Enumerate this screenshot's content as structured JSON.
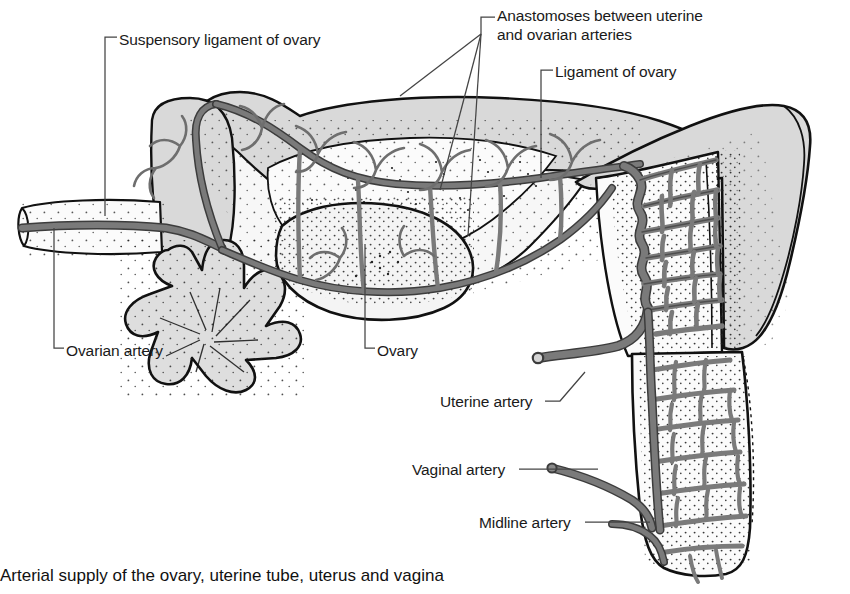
{
  "figure": {
    "caption": "Arterial supply of the ovary, uterine tube, uterus and vagina",
    "width": 850,
    "height": 594
  },
  "colors": {
    "background": "#ffffff",
    "outline": "#000000",
    "artery": "#7a7a7a",
    "artery_outline": "#3c3c3c",
    "tissue_light": "#f7f7f7",
    "tissue_shade": "#d9d9d9",
    "tissue_mid": "#e3e3e3",
    "leader_line": "#444444",
    "text": "#1a1a1a",
    "stipple": "#222222"
  },
  "labels": [
    {
      "id": "suspensory-ligament-of-ovary",
      "text": "Suspensory ligament of ovary",
      "x": 119,
      "y": 30,
      "leader": "bracket-left-down"
    },
    {
      "id": "anastomoses",
      "line1": "Anastomoses between uterine",
      "line2": "and ovarian arteries",
      "text": "Anastomoses between uterine and ovarian arteries",
      "x": 497,
      "y": 8,
      "leader": "fan-down-left"
    },
    {
      "id": "ligament-of-ovary",
      "text": "Ligament of ovary",
      "x": 555,
      "y": 62,
      "leader": "bracket-left-down"
    },
    {
      "id": "ovarian-artery",
      "text": "Ovarian artery",
      "x": 66,
      "y": 341,
      "leader": "bracket-left-up"
    },
    {
      "id": "ovary",
      "text": "Ovary",
      "x": 377,
      "y": 341,
      "leader": "bracket-left-up"
    },
    {
      "id": "uterine-artery",
      "text": "Uterine artery",
      "x": 440,
      "y": 394,
      "leader": "line-right-up"
    },
    {
      "id": "vaginal-artery",
      "text": "Vaginal artery",
      "x": 412,
      "y": 462,
      "leader": "line-right"
    },
    {
      "id": "midline-artery",
      "text": "Midline artery",
      "x": 479,
      "y": 515,
      "leader": "line-right"
    }
  ],
  "structures": [
    {
      "id": "uterine-tube",
      "name": "Uterine tube (broad ligament superior border)"
    },
    {
      "id": "mesosalpinx",
      "name": "Mesosalpinx"
    },
    {
      "id": "broad-ligament",
      "name": "Broad ligament"
    },
    {
      "id": "ovary-body",
      "name": "Ovary"
    },
    {
      "id": "fimbriae",
      "name": "Fimbriae of uterine tube"
    },
    {
      "id": "uterus-body",
      "name": "Body of uterus"
    },
    {
      "id": "uterus-fundus",
      "name": "Fundus of uterus"
    },
    {
      "id": "cervix",
      "name": "Cervix"
    },
    {
      "id": "vagina",
      "name": "Vagina"
    },
    {
      "id": "ovarian-artery-trunk",
      "name": "Ovarian artery trunk"
    },
    {
      "id": "uterine-artery-trunk",
      "name": "Uterine artery trunk"
    },
    {
      "id": "vaginal-artery-trunk",
      "name": "Vaginal artery trunk"
    },
    {
      "id": "midline-artery-trunk",
      "name": "Midline artery trunk"
    },
    {
      "id": "arcuate-network",
      "name": "Arcuate arterial network of uterine wall"
    }
  ]
}
